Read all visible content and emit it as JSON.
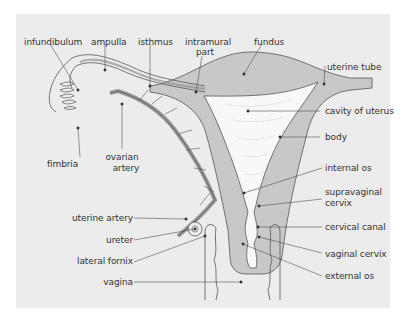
{
  "diagram": {
    "colors": {
      "background": "#ffffff",
      "panel": "#ececec",
      "tissue": "#c8c8c8",
      "cavity": "#f8f8f8",
      "stroke": "#555555",
      "leader": "#444444"
    },
    "labels": {
      "infundibulum": "infundibulum",
      "ampulla": "ampulla",
      "isthmus": "isthmus",
      "intramural_part_line1": "intramural",
      "intramural_part_line2": "part",
      "fundus": "fundus",
      "uterine_tube": "uterine tube",
      "cavity_of_uterus": "cavity of uterus",
      "body": "body",
      "internal_os": "internal os",
      "supravaginal_cervix_line1": "supravaginal",
      "supravaginal_cervix_line2": "cervix",
      "cervical_canal": "cervical canal",
      "vaginal_cervix": "vaginal cervix",
      "external_os": "external os",
      "fimbria": "fimbria",
      "ovarian_artery_line1": "ovarian",
      "ovarian_artery_line2": "artery",
      "uterine_artery": "uterine artery",
      "ureter": "ureter",
      "lateral_fornix": "lateral fornix",
      "vagina": "vagina"
    }
  }
}
